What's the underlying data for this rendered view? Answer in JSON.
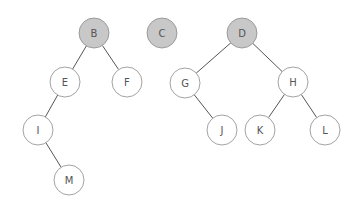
{
  "diagram": {
    "type": "forest-of-binary-trees",
    "colors": {
      "highlighted_fill": "#c8c8c8",
      "normal_fill": "#ffffff",
      "stroke": "#8a8a8a",
      "edge": "#555555",
      "label": "#555555"
    },
    "nodes": [
      {
        "id": "B",
        "label": "B",
        "x": 94,
        "y": 33,
        "highlighted": true
      },
      {
        "id": "C",
        "label": "C",
        "x": 162,
        "y": 33,
        "highlighted": true
      },
      {
        "id": "D",
        "label": "D",
        "x": 242,
        "y": 33,
        "highlighted": true
      },
      {
        "id": "E",
        "label": "E",
        "x": 65,
        "y": 82,
        "highlighted": false
      },
      {
        "id": "F",
        "label": "F",
        "x": 127,
        "y": 82,
        "highlighted": false
      },
      {
        "id": "G",
        "label": "G",
        "x": 185,
        "y": 83,
        "highlighted": false
      },
      {
        "id": "H",
        "label": "H",
        "x": 293,
        "y": 82,
        "highlighted": false
      },
      {
        "id": "I",
        "label": "I",
        "x": 38,
        "y": 130,
        "highlighted": false
      },
      {
        "id": "J",
        "label": "J",
        "x": 222,
        "y": 130,
        "highlighted": false
      },
      {
        "id": "K",
        "label": "K",
        "x": 260,
        "y": 130,
        "highlighted": false
      },
      {
        "id": "L",
        "label": "L",
        "x": 325,
        "y": 130,
        "highlighted": false
      },
      {
        "id": "M",
        "label": "M",
        "x": 69,
        "y": 180,
        "highlighted": false
      }
    ],
    "edges": [
      {
        "from": "B",
        "to": "E"
      },
      {
        "from": "B",
        "to": "F"
      },
      {
        "from": "E",
        "to": "I"
      },
      {
        "from": "I",
        "to": "M"
      },
      {
        "from": "D",
        "to": "G"
      },
      {
        "from": "D",
        "to": "H"
      },
      {
        "from": "G",
        "to": "J"
      },
      {
        "from": "H",
        "to": "K"
      },
      {
        "from": "H",
        "to": "L"
      }
    ],
    "node_radius": 15
  }
}
